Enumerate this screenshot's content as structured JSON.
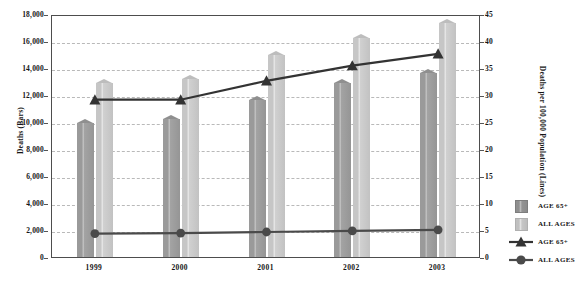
{
  "chart_data": {
    "type": "bar",
    "title": "",
    "subtitle": "",
    "xlabel": "",
    "ylabel": "Deaths (Bars)",
    "y2label": "Deaths per 100,000 Population (Lines)",
    "categories": [
      "1999",
      "2000",
      "2001",
      "2002",
      "2003"
    ],
    "ylim": [
      0,
      18000
    ],
    "y2lim": [
      0,
      45
    ],
    "yticks": [
      "0",
      "2,000",
      "4,000",
      "6,000",
      "8,000",
      "10,000",
      "12,000",
      "14,000",
      "16,000",
      "18,000"
    ],
    "ytick_values": [
      0,
      2000,
      4000,
      6000,
      8000,
      10000,
      12000,
      14000,
      16000,
      18000
    ],
    "y2ticks": [
      "0",
      "5",
      "10",
      "15",
      "20",
      "25",
      "30",
      "35",
      "40",
      "45"
    ],
    "y2tick_values": [
      0,
      5,
      10,
      15,
      20,
      25,
      30,
      35,
      40,
      45
    ],
    "grid": true,
    "legend_position": "right",
    "series": [
      {
        "name": "AGE 65+",
        "kind": "bar",
        "axis": "left",
        "color": "#9a9a9a",
        "values": [
          9950,
          10200,
          11600,
          12900,
          13600
        ]
      },
      {
        "name": "ALL AGES",
        "kind": "bar",
        "axis": "left",
        "color": "#c6c6c6",
        "values": [
          12900,
          13200,
          15000,
          16200,
          17300
        ]
      },
      {
        "name": "AGE 65+",
        "kind": "line",
        "axis": "right",
        "marker": "triangle",
        "color": "#333333",
        "values": [
          29.5,
          29.5,
          33.0,
          35.8,
          38.0
        ]
      },
      {
        "name": "ALL AGES",
        "kind": "line",
        "axis": "right",
        "marker": "circle",
        "color": "#4a4a4a",
        "values": [
          4.7,
          4.8,
          5.0,
          5.2,
          5.4
        ]
      }
    ]
  },
  "legend": {
    "items": [
      {
        "label": "AGE 65+",
        "key": "square-dark"
      },
      {
        "label": "ALL AGES",
        "key": "square-light"
      },
      {
        "label": "AGE 65+",
        "key": "triangle-line"
      },
      {
        "label": "ALL AGES",
        "key": "circle-line"
      }
    ]
  }
}
